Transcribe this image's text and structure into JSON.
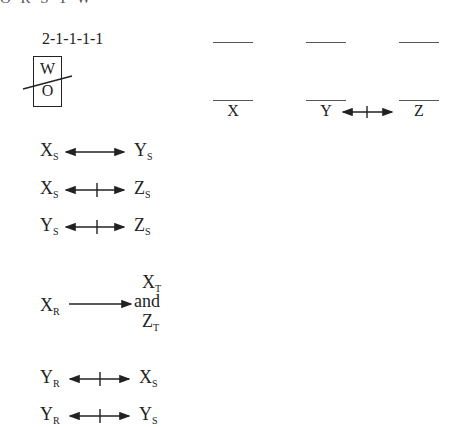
{
  "header": {
    "cut_text": "O R S T W"
  },
  "puzzle": {
    "code": "2-1-1-1-1",
    "box": {
      "top_letter": "W",
      "bottom_letter": "O",
      "struck": true
    }
  },
  "slots": [
    {
      "label": "X"
    },
    {
      "label": "Y"
    },
    {
      "label": "Z"
    }
  ],
  "slot_relation": {
    "from": "Y",
    "to": "Z",
    "type": "bidirectional-not"
  },
  "rules": [
    {
      "left": "X",
      "left_sub": "S",
      "right": "Y",
      "right_sub": "S",
      "arrow": "bidirectional"
    },
    {
      "left": "X",
      "left_sub": "S",
      "right": "Z",
      "right_sub": "S",
      "arrow": "bidirectional-not"
    },
    {
      "left": "Y",
      "left_sub": "S",
      "right": "Z",
      "right_sub": "S",
      "arrow": "bidirectional-not"
    },
    {
      "left": "X",
      "left_sub": "R",
      "right_top": "X",
      "right_top_sub": "T",
      "right_mid": "and",
      "right_bottom": "Z",
      "right_bottom_sub": "T",
      "arrow": "forward"
    },
    {
      "left": "Y",
      "left_sub": "R",
      "right": "X",
      "right_sub": "S",
      "arrow": "bidirectional-not"
    },
    {
      "left": "Y",
      "left_sub": "R",
      "right": "Y",
      "right_sub": "S",
      "arrow": "bidirectional-not"
    }
  ]
}
